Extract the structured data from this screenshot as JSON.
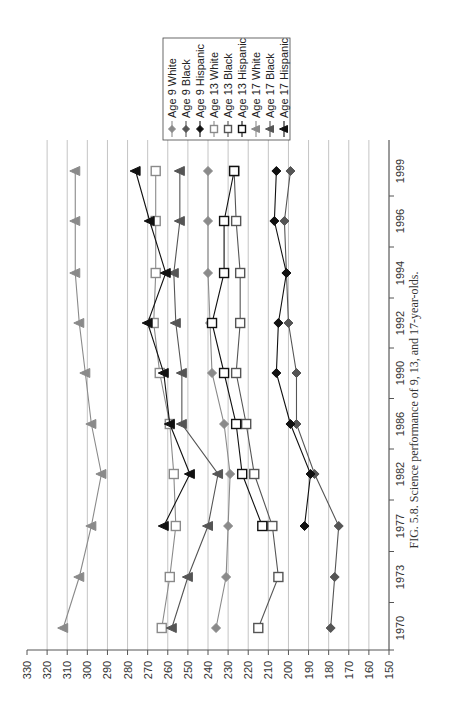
{
  "figure": {
    "caption": "FIG. 5.8.  Science performance of 9, 13, and 17-year-olds."
  },
  "chart_data": {
    "type": "line",
    "title": "",
    "caption": "FIG. 5.8.  Science performance of 9, 13, and 17-year-olds.",
    "xlabel": "",
    "ylabel": "",
    "orientation": "rotated 90° (years run vertically on right, scores run horizontally along bottom)",
    "x": [
      "1970",
      "1973",
      "1977",
      "1982",
      "1986",
      "1990",
      "1992",
      "1994",
      "1996",
      "1999"
    ],
    "ylim": [
      150,
      330
    ],
    "yticks": [
      330,
      320,
      310,
      300,
      290,
      280,
      270,
      260,
      250,
      240,
      230,
      220,
      210,
      200,
      190,
      180,
      170,
      160,
      150
    ],
    "grid": true,
    "legend_position": "top-right (rotated)",
    "series": [
      {
        "name": "Age 9 White",
        "marker": "diamond",
        "color": "#8a8a8a",
        "values": [
          236,
          231,
          230,
          229,
          232,
          238,
          239,
          240,
          240,
          240
        ]
      },
      {
        "name": "Age 9 Black",
        "marker": "diamond",
        "color": "#555555",
        "values": [
          179,
          177,
          175,
          187,
          196,
          196,
          200,
          201,
          202,
          199
        ]
      },
      {
        "name": "Age 9 Hispanic",
        "marker": "diamond",
        "color": "#111111",
        "values": [
          null,
          null,
          192,
          189,
          199,
          206,
          205,
          201,
          207,
          206
        ]
      },
      {
        "name": "Age 13 White",
        "marker": "square-open",
        "color": "#8a8a8a",
        "values": [
          263,
          259,
          256,
          257,
          259,
          264,
          267,
          266,
          266,
          266
        ]
      },
      {
        "name": "Age 13 Black",
        "marker": "square-open",
        "color": "#555555",
        "values": [
          215,
          205,
          208,
          217,
          221,
          226,
          224,
          224,
          226,
          227
        ]
      },
      {
        "name": "Age 13 Hispanic",
        "marker": "square-open",
        "color": "#111111",
        "values": [
          null,
          null,
          213,
          223,
          226,
          232,
          238,
          232,
          232,
          227
        ]
      },
      {
        "name": "Age 17 White",
        "marker": "triangle",
        "color": "#8a8a8a",
        "values": [
          312,
          304,
          298,
          293,
          298,
          301,
          304,
          306,
          306,
          306
        ]
      },
      {
        "name": "Age 17 Black",
        "marker": "triangle",
        "color": "#555555",
        "values": [
          258,
          250,
          240,
          235,
          253,
          253,
          256,
          257,
          254,
          254
        ]
      },
      {
        "name": "Age 17 Hispanic",
        "marker": "triangle",
        "color": "#111111",
        "values": [
          null,
          null,
          262,
          249,
          259,
          262,
          270,
          261,
          269,
          276
        ]
      }
    ]
  }
}
